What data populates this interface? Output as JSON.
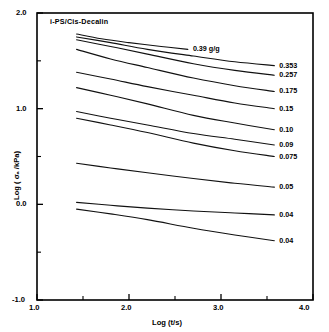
{
  "chart_data": {
    "type": "line",
    "title": "i-PS/Cis-Decalin",
    "xlabel": "Log (t/s)",
    "ylabel": "Log ( σₐ /kPa)",
    "xlim": [
      1.0,
      4.0
    ],
    "ylim": [
      -1.0,
      2.0
    ],
    "grid": false,
    "legend_position": "right-of-curve-ends",
    "xticks": [
      "1.0",
      "2.0",
      "3.0",
      "4.0"
    ],
    "xtick_values": [
      1.0,
      2.0,
      3.0,
      4.0
    ],
    "xminor_values": [
      1.5,
      2.5,
      3.5
    ],
    "yticks": [
      "2.0",
      "1.0",
      "0.0",
      "-1.0"
    ],
    "ytick_values": [
      2.0,
      1.0,
      0.0,
      -1.0
    ],
    "yminor_values": [
      1.5,
      0.5,
      -0.5
    ],
    "series": [
      {
        "name": "0.39 g/g",
        "label": "0.39 g/g",
        "x": [
          1.43,
          1.7,
          2.0,
          2.35,
          2.64
        ],
        "y": [
          1.78,
          1.73,
          1.69,
          1.65,
          1.62
        ]
      },
      {
        "name": "0.353",
        "label": "0.353",
        "x": [
          1.43,
          1.8,
          2.2,
          2.7,
          3.15,
          3.58
        ],
        "y": [
          1.75,
          1.69,
          1.62,
          1.55,
          1.49,
          1.45
        ]
      },
      {
        "name": "0.257",
        "label": "0.257",
        "x": [
          1.43,
          1.8,
          2.2,
          2.7,
          3.15,
          3.58
        ],
        "y": [
          1.72,
          1.65,
          1.57,
          1.47,
          1.4,
          1.35
        ]
      },
      {
        "name": "0.175",
        "label": "0.175",
        "x": [
          1.43,
          1.8,
          2.2,
          2.7,
          3.15,
          3.58
        ],
        "y": [
          1.62,
          1.52,
          1.43,
          1.32,
          1.24,
          1.18
        ]
      },
      {
        "name": "0.15",
        "label": "0.15",
        "x": [
          1.43,
          1.8,
          2.2,
          2.7,
          3.15,
          3.58
        ],
        "y": [
          1.38,
          1.31,
          1.23,
          1.14,
          1.06,
          1.0
        ]
      },
      {
        "name": "0.10",
        "label": "0.10",
        "x": [
          1.43,
          1.8,
          2.2,
          2.7,
          3.15,
          3.58
        ],
        "y": [
          1.22,
          1.14,
          1.05,
          0.93,
          0.85,
          0.78
        ]
      },
      {
        "name": "0.09",
        "label": "0.09",
        "x": [
          1.43,
          1.8,
          2.2,
          2.7,
          3.15,
          3.58
        ],
        "y": [
          0.97,
          0.9,
          0.83,
          0.74,
          0.68,
          0.62
        ]
      },
      {
        "name": "0.075",
        "label": "0.075",
        "x": [
          1.43,
          1.8,
          2.2,
          2.7,
          3.15,
          3.58
        ],
        "y": [
          0.9,
          0.83,
          0.75,
          0.64,
          0.56,
          0.5
        ]
      },
      {
        "name": "0.05",
        "label": "0.05",
        "x": [
          1.43,
          1.8,
          2.2,
          2.7,
          3.15,
          3.58
        ],
        "y": [
          0.43,
          0.38,
          0.33,
          0.27,
          0.22,
          0.18
        ]
      },
      {
        "name": "0.04",
        "label": "0.04",
        "x": [
          1.43,
          1.8,
          2.2,
          2.7,
          3.15,
          3.58
        ],
        "y": [
          0.02,
          -0.01,
          -0.04,
          -0.07,
          -0.09,
          -0.11
        ]
      },
      {
        "name": "0.04b",
        "label": "0.04",
        "x": [
          1.43,
          1.8,
          2.2,
          2.7,
          3.15,
          3.58
        ],
        "y": [
          -0.05,
          -0.1,
          -0.16,
          -0.25,
          -0.32,
          -0.38
        ]
      }
    ],
    "series_label_render": [
      "0.39 g/g",
      "0.353",
      "0.257",
      "0.175",
      "0.15",
      "0.10",
      "0.09",
      "0.075",
      "0.05",
      "0.04"
    ],
    "line_color": "#111111",
    "axis_color": "#000000",
    "background": "#ffffff"
  }
}
